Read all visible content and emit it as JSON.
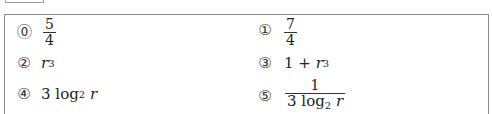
{
  "choices": [
    {
      "number": "⓪",
      "label": "0",
      "expression": "5/4",
      "numerator": "5",
      "denominator": "4"
    },
    {
      "number": "①",
      "label": "1",
      "expression": "7/4",
      "numerator": "7",
      "denominator": "4"
    },
    {
      "number": "②",
      "label": "2",
      "expression": "r^3",
      "base": "r",
      "exponent": "3"
    },
    {
      "number": "③",
      "label": "3",
      "expression": "1 + r^3",
      "prefix": "1 + ",
      "base": "r",
      "exponent": "3"
    },
    {
      "number": "④",
      "label": "4",
      "expression": "3 log_2 r",
      "coef": "3",
      "fn": "log",
      "sub": "2",
      "arg": "r"
    },
    {
      "number": "⑤",
      "label": "5",
      "expression": "1 / (3 log_2 r)",
      "numerator": "1",
      "coef": "3",
      "fn": "log",
      "sub": "2",
      "arg": "r"
    }
  ]
}
